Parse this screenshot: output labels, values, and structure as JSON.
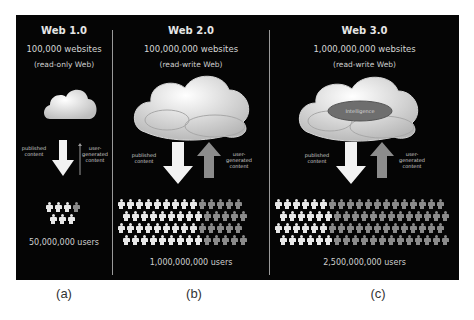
{
  "figure": {
    "panels": [
      {
        "id": "a",
        "title": "Web 1.0",
        "websites": "100,000 websites",
        "mode": "(read-only Web)",
        "cloud_label": "",
        "published_label": "published content",
        "user_label": "user-generated content",
        "users": "50,000,000 users",
        "people_rows": [
          [
            3,
            1
          ],
          [
            3,
            0
          ]
        ],
        "caption": "(a)"
      },
      {
        "id": "b",
        "title": "Web 2.0",
        "websites": "100,000,000 websites",
        "mode": "(read-write Web)",
        "cloud_label": "",
        "published_label": "published content",
        "user_label": "user-generated content",
        "users": "1,000,000,000 users",
        "people_rows": [
          [
            9,
            5
          ],
          [
            9,
            5
          ],
          [
            9,
            5
          ],
          [
            9,
            5
          ]
        ],
        "caption": "(b)"
      },
      {
        "id": "c",
        "title": "Web 3.0",
        "websites": "1,000,000,000 websites",
        "mode": "(read-write Web)",
        "cloud_label": "Intelligence",
        "published_label": "published content",
        "user_label": "user-generated content",
        "users": "2,500,000,000 users",
        "people_rows": [
          [
            6,
            13
          ],
          [
            6,
            13
          ],
          [
            6,
            13
          ],
          [
            6,
            13
          ]
        ],
        "caption": "(c)"
      }
    ],
    "colors": {
      "background": "#050505",
      "published_arrow": "#f2f2f2",
      "user_arrow": "#8c8c8c",
      "intelligence_ellipse": "#6e6e6e"
    }
  }
}
